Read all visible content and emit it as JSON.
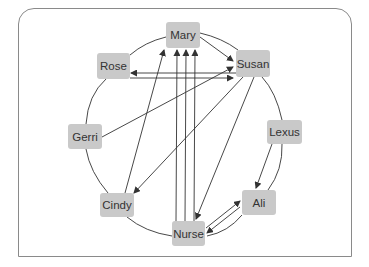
{
  "colors": {
    "node_fill": "#c9c9c9",
    "node_text": "#333333",
    "line": "#333333",
    "frame": "#8a8a8a"
  },
  "nodes": [
    {
      "id": "mary",
      "label": "Mary",
      "x": 166,
      "y": 22,
      "w": 34,
      "h": 26
    },
    {
      "id": "susan",
      "label": "Susan",
      "x": 236,
      "y": 50,
      "w": 34,
      "h": 27
    },
    {
      "id": "rose",
      "label": "Rose",
      "x": 97,
      "y": 53,
      "w": 33,
      "h": 26
    },
    {
      "id": "gerri",
      "label": "Gerri",
      "x": 68,
      "y": 124,
      "w": 34,
      "h": 25
    },
    {
      "id": "lexus",
      "label": "Lexus",
      "x": 267,
      "y": 120,
      "w": 35,
      "h": 24
    },
    {
      "id": "cindy",
      "label": "Cindy",
      "x": 100,
      "y": 193,
      "w": 34,
      "h": 24
    },
    {
      "id": "ali",
      "label": "Ali",
      "x": 242,
      "y": 190,
      "w": 34,
      "h": 25
    },
    {
      "id": "nurse",
      "label": "Nurse",
      "x": 172,
      "y": 221,
      "w": 33,
      "h": 25
    }
  ],
  "edges": [
    {
      "from": "Mary",
      "to": "Susan",
      "x1": 200,
      "y1": 37,
      "x2": 233,
      "y2": 61
    },
    {
      "from": "Susan",
      "to": "Rose",
      "x1": 236,
      "y1": 73,
      "x2": 131,
      "y2": 73
    },
    {
      "from": "Rose",
      "to": "Susan",
      "x1": 130,
      "y1": 78,
      "x2": 233,
      "y2": 78
    },
    {
      "from": "Gerri",
      "to": "Susan",
      "x1": 102,
      "y1": 137,
      "x2": 233,
      "y2": 67
    },
    {
      "from": "Cindy",
      "to": "Mary",
      "x1": 125,
      "y1": 193,
      "x2": 164,
      "y2": 50
    },
    {
      "from": "Susan",
      "to": "Cindy",
      "x1": 243,
      "y1": 77,
      "x2": 134,
      "y2": 193
    },
    {
      "from": "Susan",
      "to": "Nurse",
      "x1": 254,
      "y1": 77,
      "x2": 196,
      "y2": 219
    },
    {
      "from": "Nurse",
      "to": "Mary",
      "x1": 176,
      "y1": 221,
      "x2": 177,
      "y2": 50
    },
    {
      "from": "Nurse",
      "to": "Mary",
      "x1": 185,
      "y1": 221,
      "x2": 186,
      "y2": 50
    },
    {
      "from": "Nurse",
      "to": "Mary",
      "x1": 194,
      "y1": 221,
      "x2": 195,
      "y2": 50
    },
    {
      "from": "Lexus",
      "to": "Ali",
      "x1": 272,
      "y1": 144,
      "x2": 256,
      "y2": 188
    },
    {
      "from": "Nurse",
      "to": "Ali",
      "x1": 206,
      "y1": 228,
      "x2": 240,
      "y2": 201
    },
    {
      "from": "Ali",
      "to": "Nurse",
      "x1": 240,
      "y1": 207,
      "x2": 207,
      "y2": 233
    }
  ]
}
